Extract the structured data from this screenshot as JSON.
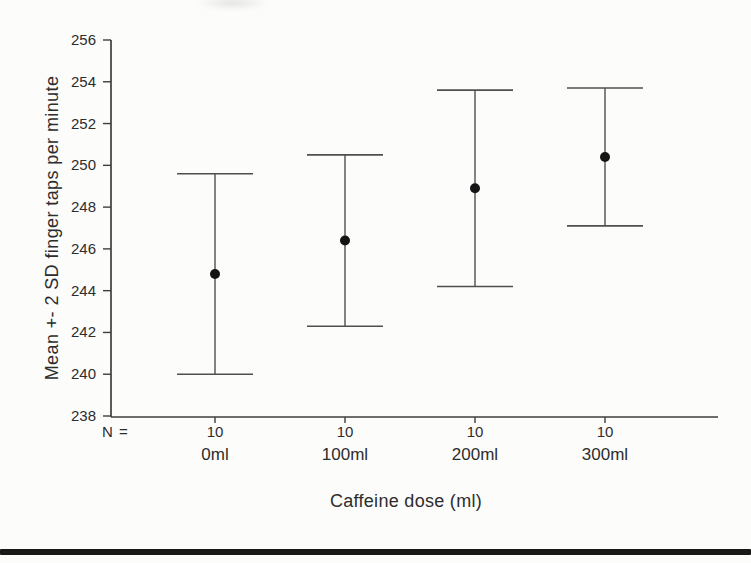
{
  "page": {
    "background": "#fcfcfb",
    "bottom_rule_color": "#181818"
  },
  "chart_data": {
    "type": "error-bar",
    "title": "",
    "xlabel": "Caffeine dose (ml)",
    "ylabel": "Mean +- 2 SD finger taps per minute",
    "categories": [
      "0ml",
      "100ml",
      "200ml",
      "300ml"
    ],
    "n_prefix": "N =",
    "n_values": [
      "10",
      "10",
      "10",
      "10"
    ],
    "yticks": [
      "256",
      "254",
      "252",
      "250",
      "248",
      "246",
      "244",
      "242",
      "240",
      "238"
    ],
    "ylim": [
      238,
      256
    ],
    "grid": false,
    "legend_position": "none",
    "marker": "filled-circle",
    "series": [
      {
        "category": "0ml",
        "n": 10,
        "mean": 244.8,
        "lower": 240.0,
        "upper": 249.6
      },
      {
        "category": "100ml",
        "n": 10,
        "mean": 246.4,
        "lower": 242.3,
        "upper": 250.5
      },
      {
        "category": "200ml",
        "n": 10,
        "mean": 248.9,
        "lower": 244.2,
        "upper": 253.6
      },
      {
        "category": "300ml",
        "n": 10,
        "mean": 250.4,
        "lower": 247.1,
        "upper": 253.7
      }
    ],
    "colors": {
      "axis": "#3e3e3e",
      "bar": "#4f4f4f",
      "marker": "#141414",
      "text": "#2d2d2d"
    }
  }
}
